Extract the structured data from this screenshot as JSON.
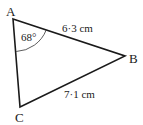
{
  "diagram": {
    "type": "triangle",
    "vertices": {
      "A": {
        "label": "A",
        "x": 13,
        "y": 19
      },
      "B": {
        "label": "B",
        "x": 125,
        "y": 56
      },
      "C": {
        "label": "C",
        "x": 20,
        "y": 107
      }
    },
    "angle_A": "68°",
    "side_AB": "6·3 cm",
    "side_BC": "7·1 cm",
    "stroke_color": "#1a1a1a"
  }
}
